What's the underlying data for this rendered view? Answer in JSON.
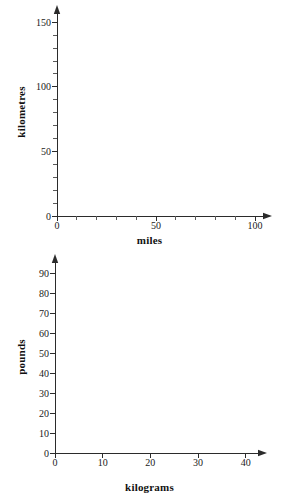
{
  "page": {
    "background_color": "#ffffff",
    "ink_color": "#1a1a1a",
    "width": 299,
    "height": 504
  },
  "chart_data": [
    {
      "id": "miles-to-kilometres",
      "type": "line",
      "title": "",
      "subtitle": "",
      "xlabel": "miles",
      "ylabel": "kilometres",
      "xlim": [
        0,
        105
      ],
      "ylim": [
        0,
        158
      ],
      "grid": false,
      "legend": null,
      "series": [],
      "x_major_ticks": [
        0,
        50,
        100
      ],
      "x_major_tick_labels": [
        "0",
        "50",
        "100"
      ],
      "x_minor_ticks": [
        10,
        20,
        30,
        40,
        60,
        70,
        80,
        90
      ],
      "y_major_ticks": [
        0,
        50,
        100,
        150
      ],
      "y_major_tick_labels": [
        "0",
        "50",
        "100",
        "150"
      ],
      "y_minor_ticks": [
        10,
        20,
        30,
        40,
        60,
        70,
        80,
        90,
        110,
        120,
        130,
        140
      ],
      "annotations": [],
      "note": "empty conversion grid - no data plotted"
    },
    {
      "id": "kilograms-to-pounds",
      "type": "line",
      "title": "",
      "subtitle": "",
      "xlabel": "kilograms",
      "ylabel": "pounds",
      "xlim": [
        0,
        43
      ],
      "ylim": [
        0,
        96
      ],
      "grid": false,
      "legend": null,
      "series": [],
      "x_major_ticks": [
        0,
        10,
        20,
        30,
        40
      ],
      "x_major_tick_labels": [
        "0",
        "10",
        "20",
        "30",
        "40"
      ],
      "x_minor_ticks": [],
      "y_major_ticks": [
        0,
        10,
        20,
        30,
        40,
        50,
        60,
        70,
        80,
        90
      ],
      "y_major_tick_labels": [
        "0",
        "10",
        "20",
        "30",
        "40",
        "50",
        "60",
        "70",
        "80",
        "90"
      ],
      "y_minor_ticks": [],
      "annotations": [],
      "note": "empty conversion grid - no data plotted"
    }
  ],
  "charts": {
    "top": {
      "x_axis_title": "miles",
      "y_axis_title": "kilometres"
    },
    "bottom": {
      "x_axis_title": "kilograms",
      "y_axis_title": "pounds"
    }
  }
}
